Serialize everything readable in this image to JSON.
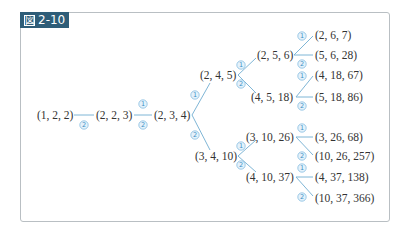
{
  "figure": {
    "label": "2-10",
    "label_icon": "figure-glyph",
    "label_glyph": "図",
    "colors": {
      "label_bg": "#2e5d78",
      "edge": "#7fb6d6",
      "badge": "#3d8fc4",
      "frame": "#b9bfc3"
    }
  },
  "tree": {
    "nodes": [
      {
        "id": "n1",
        "text": "(1, 2, 2)",
        "x": 37,
        "y": 119
      },
      {
        "id": "n2",
        "text": "(2, 2, 3)",
        "x": 96,
        "y": 119
      },
      {
        "id": "n3",
        "text": "(2, 3, 4)",
        "x": 154,
        "y": 119
      },
      {
        "id": "n4",
        "text": "(2, 4, 5)",
        "x": 200,
        "y": 79
      },
      {
        "id": "n5",
        "text": "(3, 4, 10)",
        "x": 195,
        "y": 160
      },
      {
        "id": "n6",
        "text": "(2, 5, 6)",
        "x": 257,
        "y": 59
      },
      {
        "id": "n7",
        "text": "(4, 5, 18)",
        "x": 251,
        "y": 101
      },
      {
        "id": "n8",
        "text": "(3, 10, 26)",
        "x": 246,
        "y": 141
      },
      {
        "id": "n9",
        "text": "(4, 10, 37)",
        "x": 246,
        "y": 181
      },
      {
        "id": "n10",
        "text": "(2, 6, 7)",
        "x": 315,
        "y": 39
      },
      {
        "id": "n11",
        "text": "(5, 6, 28)",
        "x": 315,
        "y": 59
      },
      {
        "id": "n12",
        "text": "(4, 18, 67)",
        "x": 315,
        "y": 79
      },
      {
        "id": "n13",
        "text": "(5, 18, 86)",
        "x": 315,
        "y": 101
      },
      {
        "id": "n14",
        "text": "(3, 26, 68)",
        "x": 315,
        "y": 141
      },
      {
        "id": "n15",
        "text": "(10, 26, 257)",
        "x": 315,
        "y": 160
      },
      {
        "id": "n16",
        "text": "(4, 37, 138)",
        "x": 315,
        "y": 181
      },
      {
        "id": "n17",
        "text": "(10, 37, 366)",
        "x": 315,
        "y": 202
      }
    ],
    "edges": [
      {
        "x1": 74,
        "y1": 115,
        "x2": 94,
        "y2": 115,
        "badge": "2",
        "bx": 84,
        "by": 125
      },
      {
        "x1": 134,
        "y1": 115,
        "x2": 152,
        "y2": 115,
        "badge": "1",
        "bx": 143,
        "by": 104,
        "badge2": "2",
        "bx2": 143,
        "by2": 125
      },
      {
        "x1": 192,
        "y1": 115,
        "x2": 210,
        "y2": 83,
        "badge": "1",
        "bx": 195,
        "by": 95
      },
      {
        "x1": 192,
        "y1": 115,
        "x2": 210,
        "y2": 150,
        "badge": "2",
        "bx": 195,
        "by": 135
      },
      {
        "x1": 238,
        "y1": 75,
        "x2": 256,
        "y2": 58,
        "badge": "1",
        "bx": 241,
        "by": 65
      },
      {
        "x1": 238,
        "y1": 75,
        "x2": 256,
        "y2": 93,
        "badge": "2",
        "bx": 241,
        "by": 84
      },
      {
        "x1": 238,
        "y1": 156,
        "x2": 256,
        "y2": 140,
        "badge": "1",
        "bx": 241,
        "by": 146
      },
      {
        "x1": 238,
        "y1": 156,
        "x2": 256,
        "y2": 172,
        "badge": "2",
        "bx": 241,
        "by": 165
      },
      {
        "x1": 294,
        "y1": 55,
        "x2": 313,
        "y2": 36,
        "badge": "1",
        "bx": 302,
        "by": 36
      },
      {
        "x1": 294,
        "y1": 55,
        "x2": 313,
        "y2": 55,
        "badge": "2",
        "bx": 302,
        "by": 64
      },
      {
        "x1": 296,
        "y1": 97,
        "x2": 313,
        "y2": 76,
        "badge": "1",
        "bx": 302,
        "by": 76
      },
      {
        "x1": 296,
        "y1": 97,
        "x2": 313,
        "y2": 97,
        "badge": "2",
        "bx": 302,
        "by": 106
      },
      {
        "x1": 296,
        "y1": 137,
        "x2": 313,
        "y2": 137,
        "badge": "1",
        "bx": 302,
        "by": 128
      },
      {
        "x1": 296,
        "y1": 137,
        "x2": 313,
        "y2": 155,
        "badge": "2",
        "bx": 302,
        "by": 156
      },
      {
        "x1": 296,
        "y1": 177,
        "x2": 313,
        "y2": 177,
        "badge": "1",
        "bx": 302,
        "by": 168
      },
      {
        "x1": 296,
        "y1": 177,
        "x2": 313,
        "y2": 196,
        "badge": "2",
        "bx": 302,
        "by": 197
      }
    ]
  }
}
